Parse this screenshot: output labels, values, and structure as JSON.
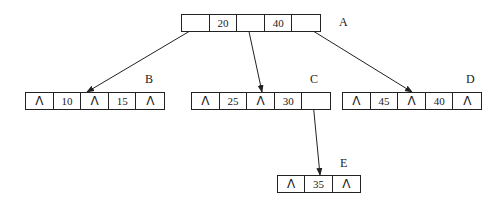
{
  "diagram": {
    "type": "b-tree",
    "nodes": [
      {
        "id": "A",
        "label": "A",
        "x": 181,
        "y": 14,
        "cell_width": 28,
        "cells": [
          {
            "type": "ptr",
            "text": ""
          },
          {
            "type": "key",
            "text": "20"
          },
          {
            "type": "ptr",
            "text": ""
          },
          {
            "type": "key",
            "text": "40"
          },
          {
            "type": "ptr",
            "text": ""
          }
        ],
        "label_pos": {
          "x": 339,
          "y": 16
        }
      },
      {
        "id": "B",
        "label": "B",
        "x": 25,
        "y": 92,
        "cell_width": 28,
        "cells": [
          {
            "type": "null",
            "text": "Λ"
          },
          {
            "type": "key",
            "text": "10"
          },
          {
            "type": "null",
            "text": "Λ"
          },
          {
            "type": "key",
            "text": "15"
          },
          {
            "type": "null",
            "text": "Λ"
          }
        ],
        "label_pos": {
          "x": 145,
          "y": 73
        }
      },
      {
        "id": "C",
        "label": "C",
        "x": 191,
        "y": 92,
        "cell_width": 28,
        "cells": [
          {
            "type": "null",
            "text": "Λ"
          },
          {
            "type": "key",
            "text": "25"
          },
          {
            "type": "null",
            "text": "Λ"
          },
          {
            "type": "key",
            "text": "30"
          },
          {
            "type": "ptr",
            "text": ""
          }
        ],
        "label_pos": {
          "x": 310,
          "y": 73
        }
      },
      {
        "id": "D",
        "label": "D",
        "x": 342,
        "y": 92,
        "cell_width": 28,
        "cells": [
          {
            "type": "null",
            "text": "Λ"
          },
          {
            "type": "key",
            "text": "45"
          },
          {
            "type": "null",
            "text": "Λ"
          },
          {
            "type": "key",
            "text": "40"
          },
          {
            "type": "null",
            "text": "Λ"
          }
        ],
        "label_pos": {
          "x": 466,
          "y": 73
        }
      },
      {
        "id": "E",
        "label": "E",
        "x": 277,
        "y": 175,
        "cell_width": 28,
        "cells": [
          {
            "type": "null",
            "text": "Λ"
          },
          {
            "type": "key",
            "text": "35"
          },
          {
            "type": "null",
            "text": "Λ"
          }
        ],
        "label_pos": {
          "x": 340,
          "y": 157
        }
      }
    ],
    "edges": [
      {
        "from": "A",
        "from_cell": 0,
        "to": "B",
        "x1": 200,
        "y1": 25,
        "x2": 87,
        "y2": 92
      },
      {
        "from": "A",
        "from_cell": 2,
        "to": "C",
        "x1": 248,
        "y1": 27,
        "x2": 262,
        "y2": 92
      },
      {
        "from": "A",
        "from_cell": 4,
        "to": "D",
        "x1": 305,
        "y1": 26,
        "x2": 412,
        "y2": 92
      },
      {
        "from": "C",
        "from_cell": 4,
        "to": "E",
        "x1": 313,
        "y1": 102,
        "x2": 320,
        "y2": 175
      }
    ],
    "colors": {
      "stroke": "#222222",
      "background": "#ffffff"
    }
  }
}
